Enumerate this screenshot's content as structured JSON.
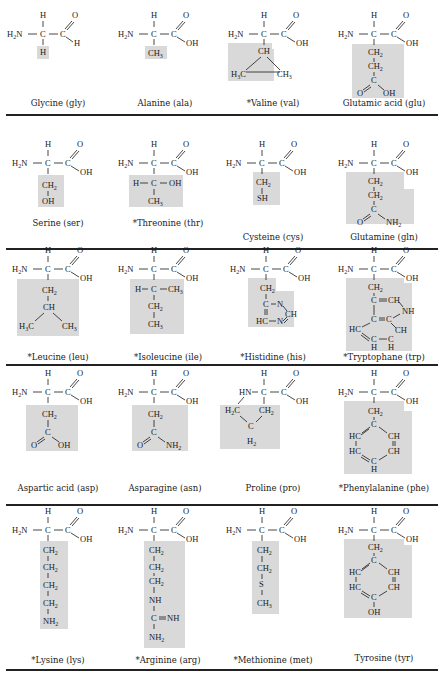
{
  "legend_note": "* = essential amino acid",
  "rows": [
    {
      "cells": [
        {
          "name": "Glycine (gly)",
          "essential": false,
          "backbone": "H2N-CH-CHO",
          "side_chain": [
            "H"
          ]
        },
        {
          "name": "Alanine (ala)",
          "essential": false,
          "backbone": "H2N-CH-COOH",
          "side_chain": [
            "CH3"
          ]
        },
        {
          "name": "Valine (val)",
          "essential": true,
          "backbone": "H2N-CH-COOH",
          "side_chain": [
            "CH",
            "H3C  CH3"
          ]
        },
        {
          "name": "Glutamic acid (glu)",
          "essential": false,
          "backbone": "H2N-CH-COOH",
          "side_chain": [
            "CH2",
            "CH2",
            "C",
            "O  OH"
          ]
        }
      ]
    },
    {
      "cells": [
        {
          "name": "Serine (ser)",
          "essential": false,
          "backbone": "H2N-CH-COOH",
          "side_chain": [
            "CH2",
            "OH"
          ]
        },
        {
          "name": "Threonine (thr)",
          "essential": true,
          "backbone": "H2N-CH-COOH",
          "side_chain": [
            "H-C-OH",
            "CH3"
          ]
        },
        {
          "name": "Cysteine (cys)",
          "essential": false,
          "backbone": "H2N-CH-COOH",
          "side_chain": [
            "CH2",
            "SH"
          ]
        },
        {
          "name": "Glutamine (gln)",
          "essential": false,
          "backbone": "H2N-CH-COOH",
          "side_chain": [
            "CH2",
            "CH2",
            "C",
            "O  NH2"
          ]
        }
      ]
    },
    {
      "cells": [
        {
          "name": "Leucine (leu)",
          "essential": true,
          "backbone": "H2N-CH-COOH",
          "side_chain": [
            "CH2",
            "CH",
            "H3C  CH3"
          ]
        },
        {
          "name": "Isoleucine (ile)",
          "essential": true,
          "backbone": "H2N-CH-COOH",
          "side_chain": [
            "H-C-CH3",
            "CH2",
            "CH3"
          ]
        },
        {
          "name": "Histidine (his)",
          "essential": true,
          "backbone": "H2N-CH-COOH",
          "side_chain": [
            "CH2",
            "C-N",
            "CH",
            "HC-N"
          ]
        },
        {
          "name": "Tryptophane (trp)",
          "essential": true,
          "backbone": "H2N-CH-COOH",
          "side_chain": [
            "CH2",
            "C=CH",
            "NH",
            "C=C",
            "CH",
            "HC",
            "C-C",
            "H  H"
          ]
        }
      ]
    },
    {
      "cells": [
        {
          "name": "Aspartic acid (asp)",
          "essential": false,
          "backbone": "H2N-CH-COOH",
          "side_chain": [
            "CH2",
            "C",
            "O  OH"
          ]
        },
        {
          "name": "Asparagine (asn)",
          "essential": false,
          "backbone": "H2N-CH-COOH",
          "side_chain": [
            "CH2",
            "C",
            "O  NH2"
          ]
        },
        {
          "name": "Proline (pro)",
          "essential": false,
          "backbone": "HN-CH-COOH",
          "side_chain": [
            "H2C",
            "CH2",
            "C",
            "H2"
          ]
        },
        {
          "name": "Phenylalanine (phe)",
          "essential": true,
          "backbone": "H2N-CH-COOH",
          "side_chain": [
            "CH2",
            "C",
            "HC  CH",
            "HC  CH",
            "C",
            "H"
          ]
        }
      ]
    },
    {
      "cells": [
        {
          "name": "Lysine (lys)",
          "essential": true,
          "backbone": "H2N-CH-COOH",
          "side_chain": [
            "CH2",
            "CH2",
            "CH2",
            "CH2",
            "NH2"
          ]
        },
        {
          "name": "Arginine (arg)",
          "essential": true,
          "backbone": "H2N-CH-COOH",
          "side_chain": [
            "CH2",
            "CH2",
            "CH2",
            "NH",
            "C=NH",
            "NH2"
          ]
        },
        {
          "name": "Methionine (met)",
          "essential": true,
          "backbone": "H2N-CH-COOH",
          "side_chain": [
            "CH2",
            "CH2",
            "S",
            "CH3"
          ]
        },
        {
          "name": "Tyrosine (tyr)",
          "essential": false,
          "backbone": "H2N-CH-COOH",
          "side_chain": [
            "CH2",
            "C",
            "HC  CH",
            "HC  CH",
            "C",
            "OH"
          ]
        }
      ]
    }
  ],
  "labels": {
    "gly": "Glycine (gly)",
    "ala": "Alanine (ala)",
    "val": "*Valine (val)",
    "glu": "Glutamic acid (glu)",
    "ser": "Serine (ser)",
    "thr": "*Threonine (thr)",
    "cys": "Cysteine (cys)",
    "gln": "Glutamine (gln)",
    "leu": "*Leucine (leu)",
    "ile": "*Isoleucine (ile)",
    "his": "*Histidine (his)",
    "trp": "*Tryptophane (trp)",
    "asp": "Aspartic acid (asp)",
    "asn": "Asparagine (asn)",
    "pro": "Proline (pro)",
    "phe": "*Phenylalanine (phe)",
    "lys": "*Lysine (lys)",
    "arg": "*Arginine (arg)",
    "met": "*Methionine (met)",
    "tyr": "Tyrosine (tyr)"
  },
  "atoms": {
    "H": "H",
    "O": "O",
    "C": "C",
    "N": "N",
    "OH": "OH",
    "HN": "HN",
    "H2N": "H",
    "NH": "NH",
    "SH": "SH",
    "S": "S",
    "CH": "CH",
    "HC": "HC",
    "N_": "N",
    "sub2": "2",
    "sub3": "3",
    "dash": "—",
    "eq": "="
  },
  "colors": {
    "shade": "#d9d9d9",
    "ink": "#1a1a1a",
    "rule": "#222222",
    "background": "#ffffff"
  }
}
